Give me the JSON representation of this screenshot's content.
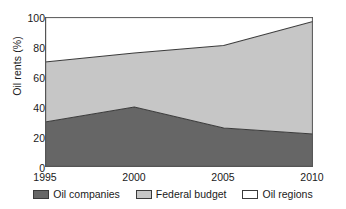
{
  "chart_data": {
    "type": "area",
    "title": "",
    "subtitle": "",
    "xlabel": "",
    "ylabel": "Oil rents (%)",
    "x": [
      1995,
      2000,
      2005,
      2010
    ],
    "xtick_labels": [
      "1995",
      "2000",
      "2005",
      "2010"
    ],
    "ytick_labels": [
      "0",
      "20",
      "40",
      "60",
      "80",
      "100"
    ],
    "ytick_values": [
      0,
      20,
      40,
      60,
      80,
      100
    ],
    "xlim": [
      1995,
      2010
    ],
    "ylim": [
      0,
      100
    ],
    "grid": false,
    "stacked": true,
    "legend_position": "bottom",
    "series": [
      {
        "name": "Oil companies",
        "color": "#666666",
        "values": [
          30,
          40,
          26,
          22
        ]
      },
      {
        "name": "Federal budget",
        "color": "#c6c6c6",
        "values": [
          40,
          36,
          55,
          75
        ]
      },
      {
        "name": "Oil regions",
        "color": "#ffffff",
        "values": [
          30,
          24,
          19,
          3
        ]
      }
    ],
    "cumulative_boundaries": {
      "oil_companies_top": [
        30,
        40,
        26,
        22
      ],
      "federal_budget_top": [
        70,
        76,
        81,
        97
      ],
      "total_top": [
        100,
        100,
        100,
        100
      ]
    }
  },
  "legend": {
    "items": [
      {
        "label": "Oil companies",
        "color": "#666666"
      },
      {
        "label": "Federal budget",
        "color": "#c6c6c6"
      },
      {
        "label": "Oil regions",
        "color": "#ffffff"
      }
    ]
  },
  "axis_colors": {
    "line": "#555555",
    "text": "#1a1a1a",
    "boundary": "#3a3a3a"
  }
}
